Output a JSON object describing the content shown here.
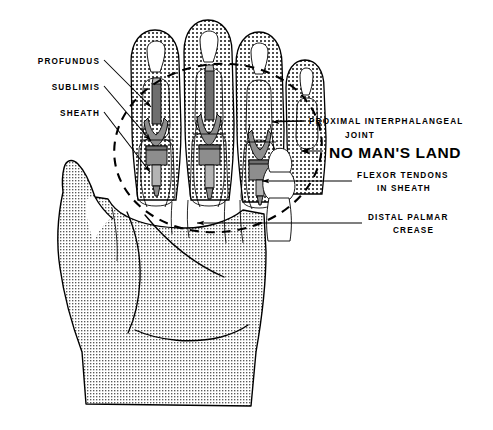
{
  "figure": {
    "title": "No Man's Land",
    "background_color": "#ffffff",
    "ink_color": "#000000",
    "tendon_color": "#8d8d8d",
    "skin_texture": "cross-hatch-stipple"
  },
  "labels": {
    "left": [
      {
        "id": "profundus",
        "text": "PROFUNDUS",
        "x": 100,
        "y": 62
      },
      {
        "id": "sublimis",
        "text": "SUBLIMIS",
        "x": 100,
        "y": 88
      },
      {
        "id": "sheath",
        "text": "SHEATH",
        "x": 100,
        "y": 113
      }
    ],
    "right": [
      {
        "id": "pip-joint-line1",
        "text": "PROXIMAL  INTERPHALANGEAL",
        "x": 307,
        "y": 124
      },
      {
        "id": "pip-joint-line2",
        "text": "JOINT",
        "x": 345,
        "y": 138
      },
      {
        "id": "flexor-tendons-line1",
        "text": "FLEXOR  TENDONS",
        "x": 357,
        "y": 178
      },
      {
        "id": "flexor-tendons-line2",
        "text": "IN  SHEATH",
        "x": 375,
        "y": 191
      },
      {
        "id": "distal-palmar-crease-line1",
        "text": "DISTAL  PALMAR",
        "x": 368,
        "y": 219
      },
      {
        "id": "distal-palmar-crease-line2",
        "text": "CREASE",
        "x": 392,
        "y": 232
      }
    ],
    "emphasis": {
      "id": "no-mans-land",
      "text": "NO MAN'S LAND",
      "x": 327,
      "y": 157,
      "bold": true,
      "arrow": "left"
    }
  },
  "zone": {
    "name": "No Man's Land",
    "shape": "dashed-ellipse",
    "center_x": 218,
    "center_y": 148,
    "radius_x": 104,
    "radius_y": 84,
    "rotation_deg": -6,
    "stroke_dash": "9 7"
  },
  "anatomy": {
    "digits": [
      {
        "name": "thumb",
        "has_visible_tendon": false
      },
      {
        "name": "index-finger",
        "has_visible_tendon": true
      },
      {
        "name": "middle-finger",
        "has_visible_tendon": true
      },
      {
        "name": "ring-finger",
        "has_visible_tendon": true
      },
      {
        "name": "little-finger",
        "has_visible_tendon": false
      }
    ],
    "structures": [
      "flexor digitorum profundus tendon",
      "flexor digitorum sublimis tendon",
      "fibrous flexor sheath",
      "proximal interphalangeal joint",
      "distal palmar crease"
    ]
  }
}
